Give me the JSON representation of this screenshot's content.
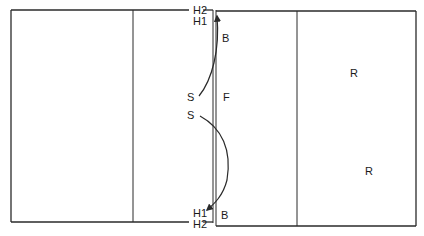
{
  "diagram": {
    "colors": {
      "line": "#2a2a2a",
      "text": "#1a1a1a",
      "background": "#ffffff"
    },
    "labels": {
      "h2_top": "H2",
      "h1_top": "H1",
      "b_top": "B",
      "s_upper": "S",
      "s_lower": "S",
      "f_center": "F",
      "h1_bottom": "H1",
      "h2_bottom": "H2",
      "b_bottom": "B",
      "r_upper": "R",
      "r_lower": "R"
    }
  }
}
